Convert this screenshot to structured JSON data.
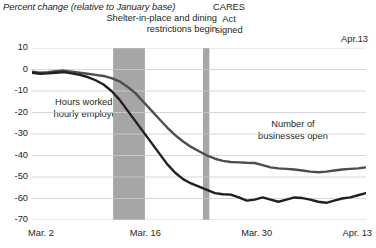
{
  "chart_data": {
    "type": "line",
    "title": "Percent change (relative to January base)",
    "xlabel": "",
    "ylabel": "Percent change",
    "ylim": [
      -70,
      10
    ],
    "yticks": [
      10,
      0,
      -10,
      -20,
      -30,
      -40,
      -50,
      -60,
      -70
    ],
    "ytick_labels": [
      "10",
      "0",
      "-10",
      "-20",
      "-30",
      "-40",
      "-50",
      "-60",
      "-70"
    ],
    "xticks": [
      "Mar. 2",
      "Mar. 16",
      "Mar. 30",
      "Apr. 13"
    ],
    "xlim": [
      "Mar. 2",
      "Apr. 13"
    ],
    "grid": true,
    "legend": "inline annotations",
    "x": [
      0,
      1,
      2,
      3,
      4,
      5,
      6,
      7,
      8,
      9,
      10,
      11,
      12,
      13,
      14,
      15,
      16,
      17,
      18,
      19,
      20,
      21,
      22,
      23,
      24,
      25,
      26,
      27,
      28,
      29,
      30,
      31,
      32,
      33,
      34,
      35,
      36,
      37,
      38,
      39,
      40,
      41,
      42
    ],
    "series": [
      {
        "name": "Number of businesses open",
        "color": "#4d4d4d",
        "values": [
          -1,
          -1.5,
          -1.2,
          -0.8,
          -0.5,
          -1,
          -1.5,
          -2,
          -2.5,
          -3,
          -4,
          -5.5,
          -8,
          -11,
          -15,
          -19,
          -23,
          -27,
          -30.5,
          -33.5,
          -36,
          -38,
          -40,
          -41.5,
          -42.5,
          -43,
          -43.2,
          -43.4,
          -43.5,
          -44.5,
          -45.5,
          -46,
          -46.2,
          -46.5,
          -47,
          -47.5,
          -47.8,
          -47.5,
          -47,
          -46.5,
          -46.2,
          -46,
          -45.5
        ]
      },
      {
        "name": "Hours worked by hourly employees",
        "color": "#231f20",
        "values": [
          -1.5,
          -2,
          -1.8,
          -1.5,
          -1.2,
          -1.8,
          -2.5,
          -3.5,
          -5,
          -7,
          -10,
          -14,
          -19,
          -24,
          -29,
          -34,
          -39,
          -44,
          -48,
          -51,
          -53,
          -54.5,
          -56,
          -57.5,
          -58,
          -58.2,
          -59.5,
          -61,
          -60.5,
          -59.5,
          -60.5,
          -61.5,
          -60.5,
          -59.5,
          -59.8,
          -60.5,
          -61.5,
          -62,
          -61,
          -60,
          -59.5,
          -58.5,
          -57.5
        ]
      }
    ],
    "bands": [
      {
        "label": "Shelter-in-place and dining restrictions begin",
        "color": "#a6a6a6",
        "x_start": 10.2,
        "x_end": 14.2
      },
      {
        "label": "CARES Act signed",
        "color": "#a6a6a6",
        "x_start": 21.5,
        "x_end": 22.3
      }
    ],
    "annotations": [
      {
        "name": "shelter-band-label",
        "text_line1": "Shelter-in-place and dining",
        "text_line2": "restrictions begin"
      },
      {
        "name": "cares-band-label",
        "text_line1": "CARES",
        "text_line2": "Act",
        "text_line3": "signed"
      },
      {
        "name": "apr13-top-label",
        "text": "Apr.13"
      },
      {
        "name": "hours-series-label",
        "text_line1": "Hours worked by",
        "text_line2": "hourly employees"
      },
      {
        "name": "businesses-series-label",
        "text_line1": "Number of",
        "text_line2": "businesses open"
      }
    ],
    "colors": {
      "grid": "#c9cdd2",
      "band": "#a6a6a6",
      "businesses_line": "#4d4d4d",
      "hours_line": "#231f20",
      "background": "#ffffff",
      "text": "#231f20"
    }
  }
}
